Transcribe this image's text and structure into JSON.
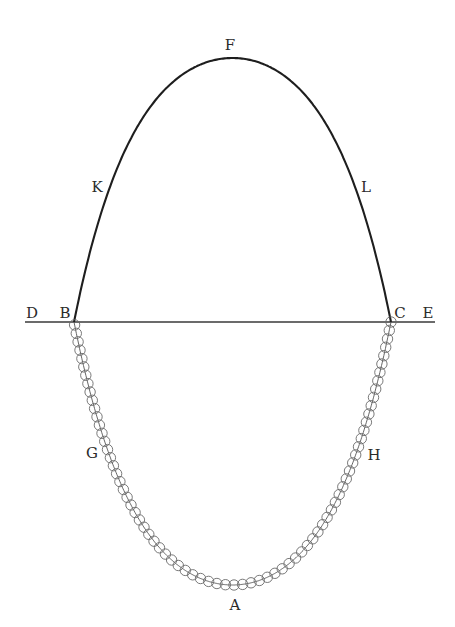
{
  "figure": {
    "colors": {
      "background": "#ffffff",
      "arch": "#1e1e1e",
      "baseline": "#3a3a3a",
      "chain": "#555555",
      "bead": "#6a6a6a",
      "label": "#2a2a2a"
    },
    "baseline": {
      "x1": 25,
      "x2": 435,
      "y": 322
    },
    "arch": {
      "left": [
        74,
        322
      ],
      "apex": [
        232,
        58
      ],
      "right": [
        391,
        322
      ]
    },
    "chain": {
      "left": [
        74,
        322
      ],
      "bottom": [
        232,
        585
      ],
      "right": [
        391,
        322
      ],
      "bead_radius": 5.2,
      "bead_spacing": 8.6
    },
    "labels": [
      {
        "id": "D",
        "text": "D",
        "x": 32,
        "y": 313
      },
      {
        "id": "B",
        "text": "B",
        "x": 65,
        "y": 313
      },
      {
        "id": "C",
        "text": "C",
        "x": 400,
        "y": 313
      },
      {
        "id": "E",
        "text": "E",
        "x": 428,
        "y": 313
      },
      {
        "id": "F",
        "text": "F",
        "x": 230,
        "y": 45
      },
      {
        "id": "K",
        "text": "K",
        "x": 97,
        "y": 187
      },
      {
        "id": "L",
        "text": "L",
        "x": 366,
        "y": 187
      },
      {
        "id": "G",
        "text": "G",
        "x": 92,
        "y": 453
      },
      {
        "id": "H",
        "text": "H",
        "x": 374,
        "y": 455
      },
      {
        "id": "A",
        "text": "A",
        "x": 235,
        "y": 605
      }
    ]
  }
}
